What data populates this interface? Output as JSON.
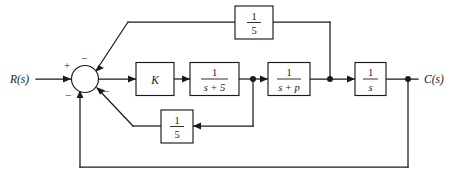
{
  "diagram": {
    "input_label": "R(s)",
    "output_label": "C(s)",
    "stroke_color": "#1a1a1a",
    "background_color": "#ffffff",
    "summing_junction": {
      "name": "summing-junction",
      "signs": {
        "input_plus": "+",
        "top_feedback_minus": "−",
        "bottom_outer_minus": "−",
        "inner_feedback_minus": "−"
      }
    },
    "blocks": [
      {
        "id": "gain-k",
        "kind": "gain",
        "label": "K"
      },
      {
        "id": "lag-s-plus-5",
        "kind": "fraction",
        "numerator": "1",
        "denominator": "s + 5"
      },
      {
        "id": "lag-s-plus-p",
        "kind": "fraction",
        "numerator": "1",
        "denominator": "s + p"
      },
      {
        "id": "integrator",
        "kind": "fraction",
        "numerator": "1",
        "denominator": "s"
      },
      {
        "id": "feedback-gain-top",
        "kind": "fraction",
        "numerator": "1",
        "denominator": "5"
      },
      {
        "id": "feedback-gain-bottom",
        "kind": "fraction",
        "numerator": "1",
        "denominator": "5"
      }
    ]
  }
}
